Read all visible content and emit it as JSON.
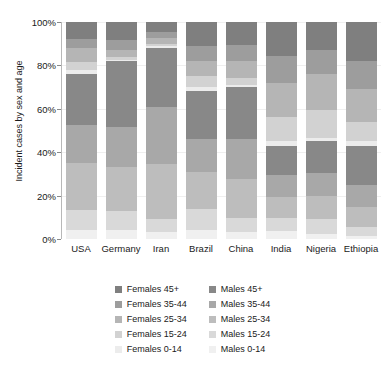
{
  "chart_data": {
    "type": "bar",
    "title": "",
    "subtitle": "",
    "xlabel": "",
    "ylabel": "Incident cases by sex and age",
    "stacked": true,
    "normalized_percent": true,
    "ylim": [
      0,
      100
    ],
    "ytick_labels": [
      "0%",
      "20%",
      "40%",
      "60%",
      "80%",
      "100%"
    ],
    "ytick_values": [
      0,
      20,
      40,
      60,
      80,
      100
    ],
    "grid": true,
    "legend_position": "bottom",
    "legend_columns": 2,
    "categories": [
      "USA",
      "Germany",
      "Iran",
      "Brazil",
      "China",
      "India",
      "Nigeria",
      "Ethiopia"
    ],
    "series": [
      {
        "name": "Females 45+",
        "color": "#7f7f7f",
        "values": [
          8.0,
          8.5,
          4.5,
          11.0,
          10.5,
          15.5,
          13.0,
          18.0
        ]
      },
      {
        "name": "Females 35-44",
        "color": "#9d9d9d",
        "values": [
          4.0,
          4.5,
          3.0,
          7.0,
          7.5,
          12.5,
          11.0,
          13.0
        ]
      },
      {
        "name": "Females 25-34",
        "color": "#b5b5b5",
        "values": [
          6.5,
          3.0,
          2.5,
          7.0,
          8.0,
          16.0,
          16.5,
          15.0
        ]
      },
      {
        "name": "Females 15-24",
        "color": "#d2d2d2",
        "values": [
          3.5,
          1.5,
          1.0,
          5.0,
          3.0,
          11.0,
          13.0,
          9.0
        ]
      },
      {
        "name": "Females 0-14",
        "color": "#ececec",
        "values": [
          2.0,
          0.5,
          1.0,
          2.0,
          1.0,
          2.0,
          1.5,
          2.0
        ]
      },
      {
        "name": "Males 45+",
        "color": "#888888",
        "values": [
          23.5,
          30.5,
          27.0,
          22.0,
          24.0,
          13.5,
          14.5,
          18.0
        ]
      },
      {
        "name": "Males 35-44",
        "color": "#a8a8a8",
        "values": [
          17.5,
          18.5,
          26.5,
          15.0,
          18.5,
          10.0,
          10.5,
          10.5
        ]
      },
      {
        "name": "Males 25-34",
        "color": "#bdbdbd",
        "values": [
          21.5,
          20.0,
          25.5,
          17.0,
          18.0,
          10.0,
          11.0,
          9.0
        ]
      },
      {
        "name": "Males 15-24",
        "color": "#d9d9d9",
        "values": [
          9.5,
          9.0,
          6.0,
          10.0,
          6.5,
          6.0,
          6.5,
          4.0
        ]
      },
      {
        "name": "Males 0-14",
        "color": "#f0f0f0",
        "values": [
          4.0,
          4.0,
          3.0,
          4.0,
          3.0,
          3.5,
          2.5,
          1.5
        ]
      }
    ]
  },
  "legend": {
    "females": [
      {
        "label": "Females 45+",
        "color": "#7f7f7f"
      },
      {
        "label": "Females 35-44",
        "color": "#9d9d9d"
      },
      {
        "label": "Females 25-34",
        "color": "#b5b5b5"
      },
      {
        "label": "Females 15-24",
        "color": "#d2d2d2"
      },
      {
        "label": "Females 0-14",
        "color": "#ececec"
      }
    ],
    "males": [
      {
        "label": "Males 45+",
        "color": "#888888"
      },
      {
        "label": "Males 35-44",
        "color": "#a8a8a8"
      },
      {
        "label": "Males 25-34",
        "color": "#bdbdbd"
      },
      {
        "label": "Males 15-24",
        "color": "#d9d9d9"
      },
      {
        "label": "Males 0-14",
        "color": "#f0f0f0"
      }
    ]
  }
}
